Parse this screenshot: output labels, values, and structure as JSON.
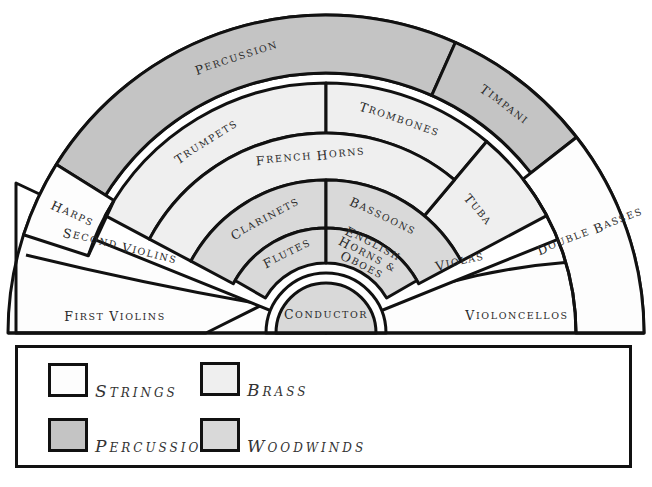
{
  "diagram": {
    "center": [
      326,
      333
    ],
    "colors": {
      "strings": "#fdfdfd",
      "brass": "#efefef",
      "percussion": "#c4c4c4",
      "woodwinds": "#d9d9d9",
      "outline": "#111111",
      "text": "#2a2a2a"
    },
    "sections": [
      {
        "id": "percussion",
        "label": "Percussion",
        "family": "percussion",
        "r0": 260,
        "r1": 318,
        "a0": 66,
        "a1": 148,
        "text_r": 289,
        "text_a": 108
      },
      {
        "id": "timpani",
        "label": "Timpani",
        "family": "percussion",
        "r0": 260,
        "r1": 318,
        "a0": 38,
        "a1": 66,
        "text_r": 289,
        "text_a": 52
      },
      {
        "id": "harps",
        "label": "Harps",
        "family": "strings",
        "r0": 250,
        "r1": 318,
        "a0": 148,
        "a1": 162,
        "text_r": 280,
        "text_a": 155,
        "radial": true
      },
      {
        "id": "double-basses",
        "label": "Double Basses",
        "family": "strings",
        "r0": 250,
        "r1": 318,
        "a0": 0,
        "a1": 38,
        "text_r": 283,
        "text_a": 21,
        "radial": true
      },
      {
        "id": "trumpets",
        "label": "Trumpets",
        "family": "brass",
        "r0": 200,
        "r1": 250,
        "a0": 90,
        "a1": 152,
        "text_r": 225,
        "text_a": 122
      },
      {
        "id": "trombones",
        "label": "Trombones",
        "family": "brass",
        "r0": 200,
        "r1": 250,
        "a0": 50,
        "a1": 90,
        "text_r": 225,
        "text_a": 71
      },
      {
        "id": "tuba",
        "label": "Tuba",
        "family": "brass",
        "r0": 153,
        "r1": 250,
        "a0": 28,
        "a1": 50,
        "text_r": 195,
        "text_a": 39
      },
      {
        "id": "french-horns",
        "label": "French Horns",
        "family": "brass",
        "r0": 153,
        "r1": 200,
        "a0": 50,
        "a1": 152,
        "text_r": 177,
        "text_a": 95
      },
      {
        "id": "clarinets",
        "label": "Clarinets",
        "family": "woodwinds",
        "r0": 105,
        "r1": 153,
        "a0": 90,
        "a1": 152,
        "text_r": 129,
        "text_a": 118
      },
      {
        "id": "bassoons",
        "label": "Bassoons",
        "family": "woodwinds",
        "r0": 105,
        "r1": 153,
        "a0": 28,
        "a1": 90,
        "text_r": 129,
        "text_a": 64
      },
      {
        "id": "flutes",
        "label": "Flutes",
        "family": "woodwinds",
        "r0": 70,
        "r1": 105,
        "a0": 90,
        "a1": 150,
        "text_r": 88,
        "text_a": 116
      },
      {
        "id": "english-horns-oboes",
        "label": "English Horns & Oboes",
        "family": "woodwinds",
        "r0": 70,
        "r1": 105,
        "a0": 30,
        "a1": 90,
        "text_r": 88,
        "text_a": 62,
        "multiline": [
          "English",
          "Horns &",
          "Oboes"
        ]
      },
      {
        "id": "conductor",
        "label": "Conductor",
        "family": "woodwinds",
        "r0": 0,
        "r1": 50,
        "a0": 0,
        "a1": 180,
        "text_r": 0,
        "text_a": 90
      }
    ],
    "strings_left": [
      {
        "id": "second-violins",
        "label": "Second Violins"
      },
      {
        "id": "first-violins",
        "label": "First Violins"
      }
    ],
    "strings_right": [
      {
        "id": "violas",
        "label": "Violas"
      },
      {
        "id": "violoncellos",
        "label": "Violoncellos"
      }
    ]
  },
  "legend": {
    "items": [
      {
        "id": "strings",
        "label": "Strings",
        "color": "#fdfdfd"
      },
      {
        "id": "brass",
        "label": "Brass",
        "color": "#efefef"
      },
      {
        "id": "percussion",
        "label": "Percussion",
        "color": "#c4c4c4"
      },
      {
        "id": "woodwinds",
        "label": "Woodwinds",
        "color": "#d9d9d9"
      }
    ]
  }
}
